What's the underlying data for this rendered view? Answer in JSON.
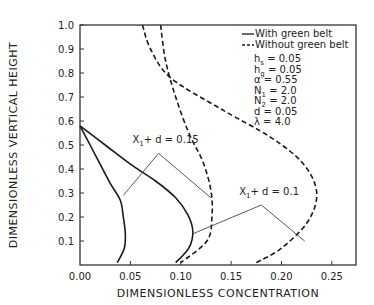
{
  "chart_data": {
    "type": "line",
    "title": "",
    "xlabel": "DIMENSIONLESS CONCENTRATION",
    "ylabel": "DIMENSIONLESS VERTICAL HEIGHT",
    "xlim": [
      0,
      0.274
    ],
    "ylim": [
      0,
      1.0
    ],
    "grid": false,
    "x_ticks": [
      0.0,
      0.05,
      0.1,
      0.15,
      0.2,
      0.25
    ],
    "x_tick_labels": [
      "0.00",
      "0.05",
      "0.10",
      "0.15",
      "0.20",
      "0.25"
    ],
    "y_ticks": [
      0.1,
      0.2,
      0.3,
      0.4,
      0.5,
      0.6,
      0.7,
      0.8,
      0.9,
      1.0
    ],
    "y_tick_labels": [
      "0.1",
      "0.2",
      "0.3",
      "0.4",
      "0.5",
      "0.6",
      "0.7",
      "0.8",
      "0.9",
      "1.0"
    ],
    "legend": {
      "placement": "top-right",
      "entries": [
        {
          "label": "With green belt",
          "style": "solid"
        },
        {
          "label": "Without green belt",
          "style": "dashed"
        }
      ]
    },
    "parameters": [
      {
        "name": "h",
        "sub": "s",
        "value": "0.05"
      },
      {
        "name": "h",
        "sub": "g",
        "value": "0.05"
      },
      {
        "name": "α",
        "sub": "",
        "value": "0.55"
      },
      {
        "name": "N",
        "sub": "1",
        "value": "2.0"
      },
      {
        "name": "N",
        "sub": "2",
        "value": "2.0"
      },
      {
        "name": "d",
        "sub": "",
        "value": "0.05"
      },
      {
        "name": "λ",
        "sub": "",
        "value": "4.0"
      }
    ],
    "series": [
      {
        "name": "With green belt, X1+d=0.15",
        "style": "solid",
        "x": [
          0.0,
          0.01,
          0.02,
          0.03,
          0.04,
          0.043,
          0.045,
          0.044,
          0.037
        ],
        "y": [
          0.58,
          0.5,
          0.42,
          0.34,
          0.27,
          0.2,
          0.13,
          0.07,
          0.01
        ]
      },
      {
        "name": "With green belt, X1+d=0.1",
        "style": "solid",
        "x": [
          0.0,
          0.025,
          0.05,
          0.075,
          0.095,
          0.107,
          0.112,
          0.108,
          0.095
        ],
        "y": [
          0.58,
          0.5,
          0.42,
          0.35,
          0.28,
          0.21,
          0.14,
          0.07,
          0.01
        ]
      },
      {
        "name": "Without green belt, X1+d=0.15",
        "style": "dashed",
        "x": [
          0.08,
          0.085,
          0.095,
          0.108,
          0.122,
          0.13,
          0.131,
          0.126,
          0.1
        ],
        "y": [
          1.0,
          0.85,
          0.7,
          0.55,
          0.43,
          0.31,
          0.2,
          0.1,
          0.01
        ]
      },
      {
        "name": "Without green belt, X1+d=0.1",
        "style": "dashed",
        "x": [
          0.062,
          0.07,
          0.09,
          0.14,
          0.19,
          0.222,
          0.235,
          0.226,
          0.2,
          0.175
        ],
        "y": [
          1.0,
          0.9,
          0.78,
          0.65,
          0.53,
          0.42,
          0.3,
          0.18,
          0.07,
          0.01
        ]
      }
    ],
    "annotations": [
      {
        "label": "X",
        "sub": "1",
        "rest": "+ d = 0.15",
        "at": [
          0.052,
          0.51
        ],
        "vertex": [
          0.078,
          0.465
        ],
        "targets": [
          [
            0.043,
            0.29
          ],
          [
            0.13,
            0.28
          ]
        ]
      },
      {
        "label": "X",
        "sub": "1",
        "rest": "+ d = 0.1",
        "at": [
          0.158,
          0.29
        ],
        "vertex": [
          0.18,
          0.25
        ],
        "targets": [
          [
            0.112,
            0.13
          ],
          [
            0.223,
            0.1
          ]
        ]
      }
    ]
  }
}
